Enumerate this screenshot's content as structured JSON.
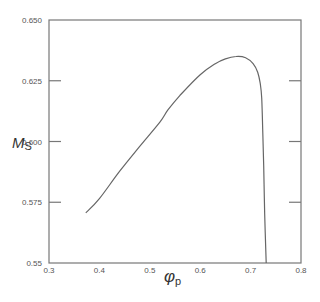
{
  "chart_data": {
    "type": "line",
    "title": "",
    "xlabel": "φ",
    "xlabel_subscript": "p",
    "ylabel": "M",
    "ylabel_subscript": "S",
    "xlim": [
      0.3,
      0.8
    ],
    "ylim": [
      0.55,
      0.65
    ],
    "xticks": [
      0.3,
      0.4,
      0.5,
      0.6,
      0.7,
      0.8
    ],
    "xtick_labels": [
      "0.3",
      "0.4",
      "0.5",
      "0.6",
      "0.7",
      "0.8"
    ],
    "yticks": [
      0.55,
      0.575,
      0.6,
      0.625,
      0.65
    ],
    "ytick_labels": [
      "0.55",
      "0.575",
      "0.600",
      "0.625",
      "0.650"
    ],
    "grid": false,
    "legend": null,
    "line_color": "#666666",
    "axis_color": "#777777",
    "series": [
      {
        "name": "Ms",
        "x": [
          0.373,
          0.4,
          0.441,
          0.48,
          0.52,
          0.536,
          0.56,
          0.6,
          0.63,
          0.65,
          0.671,
          0.69,
          0.705,
          0.714,
          0.719,
          0.722,
          0.724,
          0.726,
          0.728,
          0.731
        ],
        "y": [
          0.5706,
          0.5765,
          0.588,
          0.598,
          0.608,
          0.613,
          0.619,
          0.6275,
          0.632,
          0.634,
          0.635,
          0.6345,
          0.632,
          0.6285,
          0.624,
          0.618,
          0.605,
          0.59,
          0.57,
          0.55
        ]
      }
    ]
  }
}
